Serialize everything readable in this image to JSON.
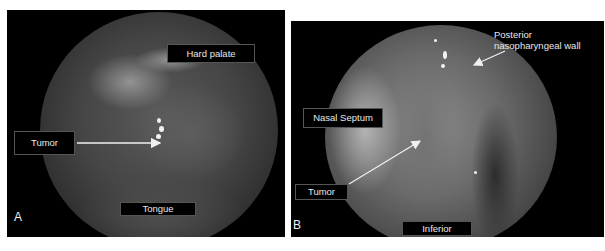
{
  "figure": {
    "panels": [
      {
        "letter": "A",
        "labels": {
          "hard_palate": "Hard palate",
          "tumor": "Tumor",
          "tongue": "Tongue"
        }
      },
      {
        "letter": "B",
        "labels": {
          "posterior_wall_line1": "Posterior",
          "posterior_wall_line2": "nasopharyngeal wall",
          "nasal_septum": "Nasal Septum",
          "tumor": "Tumor",
          "inferior": "Inferior"
        }
      }
    ],
    "colors": {
      "background": "#ffffff",
      "panel": "#000000",
      "label_text": "#e8e8e8",
      "arrow": "#f0f0f0"
    }
  }
}
